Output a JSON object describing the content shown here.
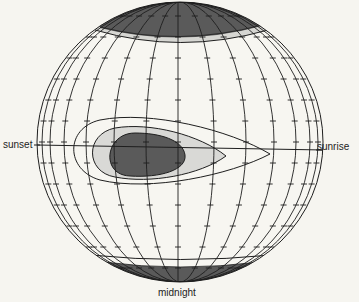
{
  "figure": {
    "type": "globe-diagram",
    "labels": {
      "sunset": "sunset",
      "sunrise": "sunrise",
      "midnight": "midnight"
    },
    "colors": {
      "background": "#f6f5f0",
      "sphere_fill": "#f7f6f1",
      "line": "#1e1e1e",
      "dark_region": "#5a5a5a",
      "light_region": "#d9d9d6",
      "cap_band": "#d6d6d2"
    },
    "regions": [
      {
        "name": "north-polar-cap",
        "shade": "dark"
      },
      {
        "name": "south-polar-cap",
        "shade": "dark"
      },
      {
        "name": "central-dark-core",
        "shade": "dark"
      },
      {
        "name": "central-light-zone",
        "shade": "light"
      },
      {
        "name": "outer-teardrop-contour",
        "shade": "none"
      }
    ]
  }
}
